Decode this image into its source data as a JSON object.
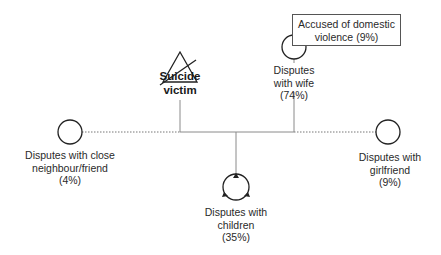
{
  "diagram": {
    "type": "genogram",
    "center": {
      "label_line1": "Suicide",
      "label_line2": "victim",
      "symbol": "triangle-with-slash"
    },
    "relations": [
      {
        "id": "neighbour",
        "line1": "Disputes with close",
        "line2": "neighbour/friend",
        "pct": "(4%)",
        "line_style": "dotted"
      },
      {
        "id": "wife",
        "line1": "Disputes",
        "line2": "with wife",
        "pct": "(74%)",
        "line_style": "solid"
      },
      {
        "id": "children",
        "line1": "Disputes with",
        "line2": "children",
        "pct": "(35%)",
        "line_style": "solid"
      },
      {
        "id": "girlfriend",
        "line1": "Disputes with",
        "line2": "girlfriend",
        "pct": "(9%)",
        "line_style": "dotted"
      }
    ],
    "annotation": {
      "line1": "Accused of domestic",
      "line2": "violence (9%)"
    }
  },
  "colors": {
    "stroke": "#222222",
    "line": "#8a8a8a",
    "text": "#2a2a2a"
  }
}
